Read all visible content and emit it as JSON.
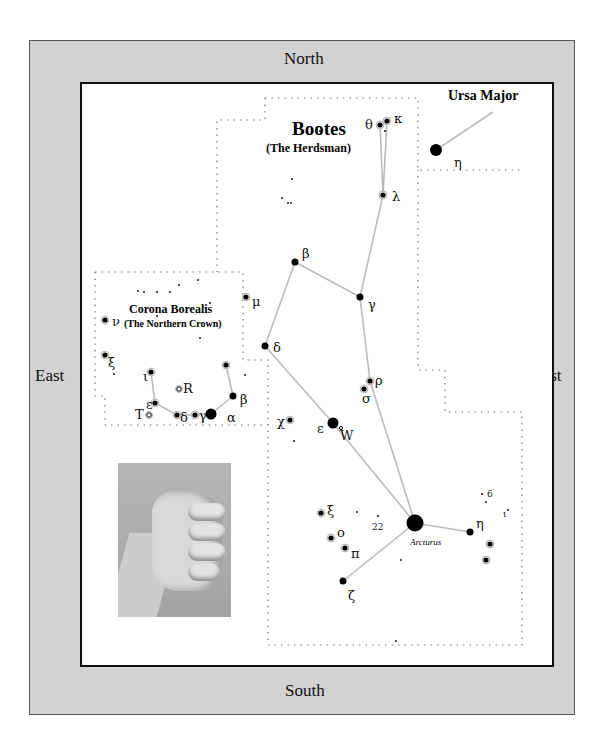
{
  "directions": {
    "north": "North",
    "south": "South",
    "east": "East",
    "west": "West"
  },
  "colors": {
    "frame": "#d2d2d2",
    "map_bg": "#ffffff",
    "line": "#bbbbbb",
    "star": "#000000",
    "border_line": "#111111"
  },
  "labels": {
    "bootes_title": "Bootes",
    "bootes_subtitle": "(The Herdsman)",
    "corona_title": "Corona Borealis",
    "corona_subtitle": "(The Northern Crown)",
    "ursa_title": "Ursa Major",
    "arcturus": "Arcturus"
  },
  "photo": {
    "subject": "closed fist (hand-measure reference)"
  },
  "stars": [
    {
      "id": "boo-theta",
      "label": "θ",
      "x": 380,
      "y": 125,
      "r": 2.6,
      "lx": -15,
      "ly": 4
    },
    {
      "id": "boo-kappa",
      "label": "κ",
      "x": 387,
      "y": 121,
      "r": 2.6,
      "lx": 7,
      "ly": 2
    },
    {
      "id": "boo-lambda",
      "label": "λ",
      "x": 383,
      "y": 195,
      "r": 2.6,
      "lx": 9,
      "ly": 6
    },
    {
      "id": "boo-beta",
      "label": "β",
      "x": 295,
      "y": 262,
      "r": 3.5,
      "lx": 7,
      "ly": -4
    },
    {
      "id": "boo-gamma",
      "label": "γ",
      "x": 360,
      "y": 297,
      "r": 3.5,
      "lx": 8,
      "ly": 12
    },
    {
      "id": "boo-delta",
      "label": "δ",
      "x": 265,
      "y": 346,
      "r": 3.5,
      "lx": 8,
      "ly": 6
    },
    {
      "id": "boo-mu",
      "label": "μ",
      "x": 246,
      "y": 297,
      "r": 2.6,
      "lx": 6,
      "ly": 9
    },
    {
      "id": "boo-rho",
      "label": "ρ",
      "x": 370,
      "y": 381,
      "r": 2.6,
      "lx": 5,
      "ly": 4
    },
    {
      "id": "boo-sigma",
      "label": "σ",
      "x": 364,
      "y": 389,
      "r": 2.6,
      "lx": -2,
      "ly": 14
    },
    {
      "id": "boo-epsilon",
      "label": "ε",
      "x": 333,
      "y": 423,
      "r": 5.5,
      "lx": -16,
      "ly": 10
    },
    {
      "id": "boo-w",
      "label": "W",
      "x": 341,
      "y": 428,
      "r": 1.6,
      "lx": -1,
      "ly": 12
    },
    {
      "id": "boo-chi",
      "label": "χ",
      "x": 290,
      "y": 420,
      "r": 2.6,
      "lx": -13,
      "ly": 6
    },
    {
      "id": "boo-alpha",
      "label": "",
      "x": 415,
      "y": 523,
      "r": 8.5,
      "lx": 0,
      "ly": 0
    },
    {
      "id": "boo-eta",
      "label": "η",
      "x": 470,
      "y": 532,
      "r": 3.5,
      "lx": 6,
      "ly": -4
    },
    {
      "id": "boo-zeta",
      "label": "ζ",
      "x": 343,
      "y": 581,
      "r": 3.5,
      "lx": 5,
      "ly": 19
    },
    {
      "id": "boo-xi",
      "label": "ξ",
      "x": 321,
      "y": 513,
      "r": 2.6,
      "lx": 6,
      "ly": 2
    },
    {
      "id": "boo-omicron",
      "label": "o",
      "x": 331,
      "y": 538,
      "r": 2.6,
      "lx": 6,
      "ly": -1
    },
    {
      "id": "boo-pi",
      "label": "π",
      "x": 345,
      "y": 548,
      "r": 2.6,
      "lx": 6,
      "ly": 10
    },
    {
      "id": "boo-22",
      "label": "22",
      "x": 378,
      "y": 516,
      "r": 1,
      "lx": -6,
      "ly": 14
    },
    {
      "id": "boo-6",
      "label": "6",
      "x": 482,
      "y": 494,
      "r": 1,
      "lx": 5,
      "ly": 3
    },
    {
      "id": "boo-1",
      "label": "ι",
      "x": 508,
      "y": 510,
      "r": 1,
      "lx": -5,
      "ly": 7
    },
    {
      "id": "boo-s1",
      "label": "",
      "x": 490,
      "y": 544,
      "r": 2.6,
      "lx": 0,
      "ly": 0
    },
    {
      "id": "boo-s2",
      "label": "",
      "x": 486,
      "y": 560,
      "r": 2.6,
      "lx": 0,
      "ly": 0
    },
    {
      "id": "uma-eta",
      "label": "η",
      "x": 436,
      "y": 150,
      "r": 6,
      "lx": 18,
      "ly": 17
    },
    {
      "id": "crb-alpha",
      "label": "α",
      "x": 211,
      "y": 414,
      "r": 5.5,
      "lx": 16,
      "ly": 8
    },
    {
      "id": "crb-beta",
      "label": "β",
      "x": 233,
      "y": 396,
      "r": 3.5,
      "lx": 7,
      "ly": 8
    },
    {
      "id": "crb-theta",
      "label": "",
      "x": 226,
      "y": 365,
      "r": 2.6,
      "lx": 0,
      "ly": 0
    },
    {
      "id": "crb-gamma",
      "label": "γ",
      "x": 195,
      "y": 415,
      "r": 2.6,
      "lx": 4,
      "ly": 5
    },
    {
      "id": "crb-delta",
      "label": "δ",
      "x": 177,
      "y": 415,
      "r": 2.6,
      "lx": 3,
      "ly": 7
    },
    {
      "id": "crb-epsilon",
      "label": "ε",
      "x": 155,
      "y": 403,
      "r": 2.6,
      "lx": -9,
      "ly": 6
    },
    {
      "id": "crb-iota",
      "label": "ι",
      "x": 151,
      "y": 372,
      "r": 2.6,
      "lx": -8,
      "ly": 9
    },
    {
      "id": "crb-R",
      "label": "R",
      "x": 179,
      "y": 389,
      "r": 2.2,
      "lx": 4,
      "ly": 4
    },
    {
      "id": "crb-T",
      "label": "T",
      "x": 149,
      "y": 415,
      "r": 2.2,
      "lx": -14,
      "ly": 4
    },
    {
      "id": "crb-nu",
      "label": "ν",
      "x": 105,
      "y": 320,
      "r": 2.6,
      "lx": 7,
      "ly": 6
    },
    {
      "id": "crb-xi",
      "label": "ξ",
      "x": 105,
      "y": 355,
      "r": 2.6,
      "lx": 3,
      "ly": 12
    }
  ],
  "faint_stars": [
    [
      138,
      291
    ],
    [
      144,
      292
    ],
    [
      157,
      292
    ],
    [
      170,
      292
    ],
    [
      179,
      285
    ],
    [
      198,
      280
    ],
    [
      157,
      316
    ],
    [
      210,
      303
    ],
    [
      200,
      338
    ],
    [
      114,
      374
    ],
    [
      245,
      375
    ],
    [
      294,
      441
    ],
    [
      292,
      179
    ],
    [
      282,
      198
    ],
    [
      288,
      203
    ],
    [
      291,
      203
    ],
    [
      385,
      131
    ],
    [
      401,
      560
    ],
    [
      396,
      641
    ],
    [
      320,
      131
    ],
    [
      357,
      512
    ],
    [
      486,
      502
    ]
  ],
  "lines": [
    [
      380,
      125,
      387,
      121
    ],
    [
      380,
      125,
      383,
      195
    ],
    [
      387,
      121,
      383,
      195
    ],
    [
      383,
      195,
      360,
      297
    ],
    [
      360,
      297,
      295,
      262
    ],
    [
      295,
      262,
      265,
      346
    ],
    [
      265,
      346,
      333,
      423
    ],
    [
      333,
      423,
      415,
      523
    ],
    [
      360,
      297,
      370,
      381
    ],
    [
      370,
      381,
      415,
      523
    ],
    [
      415,
      523,
      470,
      532
    ],
    [
      415,
      523,
      343,
      581
    ],
    [
      436,
      150,
      493,
      112
    ],
    [
      151,
      372,
      155,
      403
    ],
    [
      155,
      403,
      177,
      415
    ],
    [
      177,
      415,
      195,
      415
    ],
    [
      195,
      415,
      211,
      414
    ],
    [
      211,
      414,
      233,
      396
    ],
    [
      233,
      396,
      226,
      365
    ]
  ],
  "boundaries": [
    "M265,98 L418,98 L418,170 L522,170",
    "M265,98 L265,120 L217,120 L217,272",
    "M95,272 L243,272 L243,360 L268,360 L268,645 L522,645 L522,412 L445,412 L445,370 L418,370 L418,170",
    "M95,272 L95,396 L105,396 L105,425 L268,425"
  ]
}
